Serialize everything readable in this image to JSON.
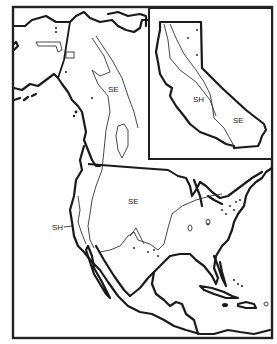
{
  "map": {
    "type": "zone map of North America with California inset",
    "labels": {
      "north_zone": "SE",
      "main_zone": "SE",
      "west_coast_zone": "SH",
      "inset_sh": "SH",
      "inset_se": "SE"
    },
    "colors": {
      "ink": "#1a1a1a",
      "background": "#ffffff"
    }
  }
}
